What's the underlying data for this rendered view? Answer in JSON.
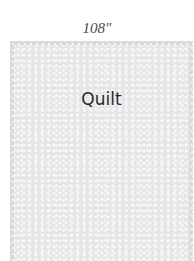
{
  "dimension": {
    "label": "108\""
  },
  "quilt": {
    "label": "Quilt",
    "color": "#e6e6e6"
  }
}
